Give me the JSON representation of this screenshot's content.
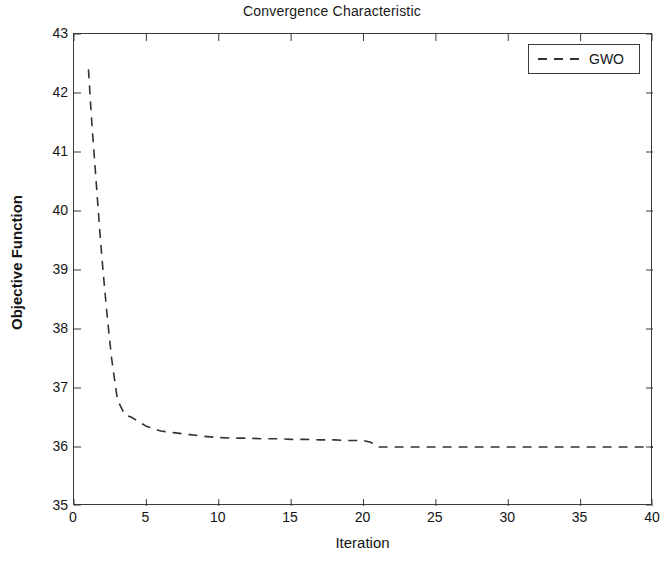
{
  "chart_data": {
    "type": "line",
    "title": "Convergence Characteristic",
    "xlabel": "Iteration",
    "ylabel": "Objective Function",
    "xlim": [
      0,
      40
    ],
    "ylim": [
      35,
      43
    ],
    "xticks": [
      0,
      5,
      10,
      15,
      20,
      25,
      30,
      35,
      40
    ],
    "yticks": [
      35,
      36,
      37,
      38,
      39,
      40,
      41,
      42,
      43
    ],
    "grid": false,
    "legend_position": "top-right",
    "line_style": "dashed",
    "line_color": "#333333",
    "series": [
      {
        "name": "GWO",
        "x": [
          1,
          1.2,
          1.5,
          1.8,
          2.0,
          2.3,
          2.6,
          3.0,
          3.5,
          4,
          5,
          6,
          7,
          8,
          9,
          10,
          11,
          12,
          13,
          14,
          15,
          16,
          17,
          18,
          19,
          20,
          20.5,
          21,
          22,
          24,
          26,
          28,
          30,
          32,
          34,
          36,
          38,
          40
        ],
        "values": [
          42.4,
          41.6,
          40.6,
          39.6,
          39.0,
          38.2,
          37.5,
          36.8,
          36.55,
          36.5,
          36.35,
          36.27,
          36.24,
          36.21,
          36.18,
          36.16,
          36.15,
          36.15,
          36.14,
          36.14,
          36.13,
          36.13,
          36.12,
          36.12,
          36.11,
          36.11,
          36.08,
          36.0,
          36.0,
          36.0,
          36.0,
          36.0,
          36.0,
          36.0,
          36.0,
          36.0,
          36.0,
          36.0
        ]
      }
    ]
  },
  "legend": {
    "entries": [
      {
        "label": "GWO"
      }
    ]
  },
  "axes": {
    "y_tick_labels": [
      "43",
      "42",
      "41",
      "40",
      "39",
      "38",
      "37",
      "36",
      "35"
    ],
    "x_tick_labels": [
      "0",
      "5",
      "10",
      "15",
      "20",
      "25",
      "30",
      "35",
      "40"
    ]
  }
}
